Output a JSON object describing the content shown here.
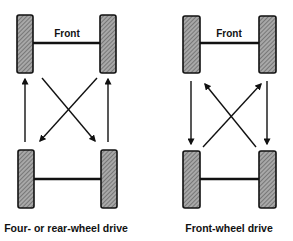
{
  "diagrams": [
    {
      "id": "four-rear",
      "front_label": "Front",
      "caption": "Four- or rear-wheel drive",
      "pattern": "rear tires cross forward; front tires move straight back"
    },
    {
      "id": "front-wheel",
      "front_label": "Front",
      "caption": "Front-wheel drive",
      "pattern": "front tires move straight back; rear tires cross forward"
    }
  ],
  "colors": {
    "ink": "#111111",
    "tire_fill": "#8a8a8a",
    "background": "#ffffff"
  }
}
